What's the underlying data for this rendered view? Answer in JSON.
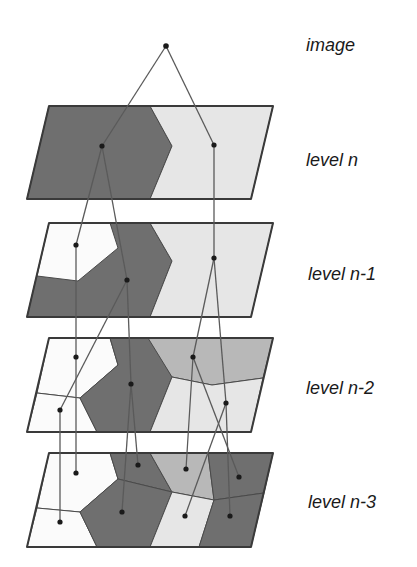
{
  "colors": {
    "dark": "#6f6f6f",
    "mid": "#b8b8b8",
    "light": "#e6e6e6",
    "white": "#fbfbfb",
    "outline": "#3a3a3a",
    "edge": "#5a5a5a",
    "node": "#1a1a1a"
  },
  "labels": {
    "image": "image",
    "level_n": "level n",
    "level_n1": "level n-1",
    "level_n2": "level n-2",
    "level_n3": "level n-3"
  },
  "root_node": {
    "x": 166,
    "y": 46
  },
  "levels": [
    {
      "name": "level n",
      "outline": [
        [
          49,
          106
        ],
        [
          273,
          106
        ],
        [
          251,
          199
        ],
        [
          27,
          199
        ]
      ],
      "regions": [
        {
          "fill": "dark",
          "points": [
            [
              49,
              106
            ],
            [
              150,
              106
            ],
            [
              172,
              146
            ],
            [
              150,
              199
            ],
            [
              27,
              199
            ]
          ]
        },
        {
          "fill": "light",
          "points": [
            [
              150,
              106
            ],
            [
              273,
              106
            ],
            [
              251,
              199
            ],
            [
              150,
              199
            ],
            [
              172,
              146
            ]
          ]
        }
      ],
      "nodes": [
        [
          102,
          146
        ],
        [
          214,
          145
        ]
      ]
    },
    {
      "name": "level n-1",
      "outline": [
        [
          49,
          223
        ],
        [
          273,
          223
        ],
        [
          251,
          317
        ],
        [
          27,
          317
        ]
      ],
      "regions": [
        {
          "fill": "dark",
          "points": [
            [
              49,
              223
            ],
            [
              150,
              223
            ],
            [
              172,
              261
            ],
            [
              150,
              317
            ],
            [
              27,
              317
            ]
          ]
        },
        {
          "fill": "white",
          "points": [
            [
              49,
              223
            ],
            [
              110,
              223
            ],
            [
              118,
              248
            ],
            [
              78,
              281
            ],
            [
              37,
              276
            ]
          ]
        },
        {
          "fill": "light",
          "points": [
            [
              150,
              223
            ],
            [
              273,
              223
            ],
            [
              251,
              317
            ],
            [
              150,
              317
            ],
            [
              172,
              261
            ]
          ]
        }
      ],
      "nodes": [
        [
          76,
          245
        ],
        [
          127,
          280
        ],
        [
          214,
          258
        ]
      ]
    },
    {
      "name": "level n-2",
      "outline": [
        [
          49,
          338
        ],
        [
          273,
          338
        ],
        [
          251,
          432
        ],
        [
          27,
          432
        ]
      ],
      "regions": [
        {
          "fill": "white",
          "points": [
            [
              49,
              338
            ],
            [
              110,
              338
            ],
            [
              118,
              365
            ],
            [
              80,
              398
            ],
            [
              37,
              393
            ]
          ]
        },
        {
          "fill": "white",
          "points": [
            [
              37,
              393
            ],
            [
              80,
              398
            ],
            [
              97,
              432
            ],
            [
              27,
              432
            ]
          ]
        },
        {
          "fill": "dark",
          "points": [
            [
              110,
              338
            ],
            [
              150,
              338
            ],
            [
              172,
              377
            ],
            [
              150,
              432
            ],
            [
              97,
              432
            ],
            [
              80,
              398
            ],
            [
              118,
              365
            ]
          ]
        },
        {
          "fill": "mid",
          "points": [
            [
              148,
              338
            ],
            [
              273,
              338
            ],
            [
              263,
              378
            ],
            [
              212,
              385
            ],
            [
              172,
              377
            ]
          ]
        },
        {
          "fill": "light",
          "points": [
            [
              172,
              377
            ],
            [
              212,
              385
            ],
            [
              263,
              378
            ],
            [
              251,
              432
            ],
            [
              150,
              432
            ]
          ]
        }
      ],
      "nodes": [
        [
          76,
          357
        ],
        [
          60,
          410
        ],
        [
          131,
          384
        ],
        [
          193,
          357
        ],
        [
          226,
          403
        ]
      ]
    },
    {
      "name": "level n-3",
      "outline": [
        [
          49,
          453
        ],
        [
          273,
          453
        ],
        [
          251,
          547
        ],
        [
          27,
          547
        ]
      ],
      "regions": [
        {
          "fill": "white",
          "points": [
            [
              49,
              453
            ],
            [
              110,
              453
            ],
            [
              118,
              479
            ],
            [
              80,
              512
            ],
            [
              37,
              508
            ]
          ]
        },
        {
          "fill": "white",
          "points": [
            [
              37,
              508
            ],
            [
              80,
              512
            ],
            [
              97,
              547
            ],
            [
              27,
              547
            ]
          ]
        },
        {
          "fill": "dark",
          "points": [
            [
              110,
              453
            ],
            [
              150,
              453
            ],
            [
              172,
              492
            ],
            [
              118,
              479
            ]
          ]
        },
        {
          "fill": "dark",
          "points": [
            [
              118,
              479
            ],
            [
              172,
              492
            ],
            [
              150,
              547
            ],
            [
              97,
              547
            ],
            [
              80,
              512
            ]
          ]
        },
        {
          "fill": "mid",
          "points": [
            [
              150,
              453
            ],
            [
              208,
              453
            ],
            [
              214,
              500
            ],
            [
              172,
              492
            ]
          ]
        },
        {
          "fill": "dark",
          "points": [
            [
              208,
              453
            ],
            [
              273,
              453
            ],
            [
              264,
              493
            ],
            [
              214,
              500
            ]
          ]
        },
        {
          "fill": "light",
          "points": [
            [
              172,
              492
            ],
            [
              214,
              500
            ],
            [
              199,
              547
            ],
            [
              150,
              547
            ]
          ]
        },
        {
          "fill": "dark",
          "points": [
            [
              214,
              500
            ],
            [
              264,
              493
            ],
            [
              251,
              547
            ],
            [
              199,
              547
            ]
          ]
        }
      ],
      "nodes": [
        [
          76,
          473
        ],
        [
          60,
          522
        ],
        [
          138,
          465
        ],
        [
          122,
          512
        ],
        [
          186,
          469
        ],
        [
          239,
          477
        ],
        [
          185,
          516
        ],
        [
          230,
          516
        ]
      ]
    }
  ],
  "edges": [
    [
      [
        166,
        46
      ],
      [
        102,
        146
      ]
    ],
    [
      [
        166,
        46
      ],
      [
        214,
        145
      ]
    ],
    [
      [
        102,
        146
      ],
      [
        76,
        245
      ]
    ],
    [
      [
        102,
        146
      ],
      [
        127,
        280
      ]
    ],
    [
      [
        214,
        145
      ],
      [
        214,
        258
      ]
    ],
    [
      [
        76,
        245
      ],
      [
        76,
        357
      ]
    ],
    [
      [
        127,
        280
      ],
      [
        60,
        410
      ]
    ],
    [
      [
        127,
        280
      ],
      [
        131,
        384
      ]
    ],
    [
      [
        214,
        258
      ],
      [
        193,
        357
      ]
    ],
    [
      [
        214,
        258
      ],
      [
        226,
        403
      ]
    ],
    [
      [
        76,
        357
      ],
      [
        76,
        473
      ]
    ],
    [
      [
        60,
        410
      ],
      [
        60,
        522
      ]
    ],
    [
      [
        131,
        384
      ],
      [
        138,
        465
      ]
    ],
    [
      [
        131,
        384
      ],
      [
        122,
        512
      ]
    ],
    [
      [
        193,
        357
      ],
      [
        186,
        469
      ]
    ],
    [
      [
        193,
        357
      ],
      [
        239,
        477
      ]
    ],
    [
      [
        226,
        403
      ],
      [
        185,
        516
      ]
    ],
    [
      [
        226,
        403
      ],
      [
        230,
        516
      ]
    ]
  ]
}
